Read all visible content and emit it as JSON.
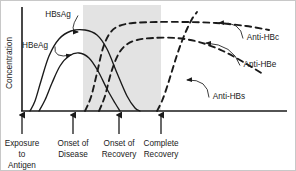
{
  "chart_data": {
    "type": "line",
    "title": "",
    "subtitle": "",
    "xlabel": "",
    "ylabel": "Concentration",
    "grid": false,
    "legend_position": "inline-annotations",
    "xlim": [
      0,
      1
    ],
    "ylim": [
      0,
      1
    ],
    "x_event_labels": [
      {
        "id": "exposure",
        "line1": "Exposure",
        "line2": "to",
        "line3": "Antigen",
        "x_px": 21
      },
      {
        "id": "onset-disease",
        "line1": "Onset of",
        "line2": "Disease",
        "line3": "",
        "x_px": 72
      },
      {
        "id": "onset-recovery",
        "line1": "Onset of",
        "line2": "Recovery",
        "line3": "",
        "x_px": 118
      },
      {
        "id": "complete-recovery",
        "line1": "Complete",
        "line2": "Recovery",
        "line3": "",
        "x_px": 160
      }
    ],
    "shaded_region": {
      "label": "acute disease period",
      "x_start_px": 82,
      "x_end_px": 160,
      "color": "#e3e3e3"
    },
    "series": [
      {
        "name": "HBsAg",
        "style": "solid",
        "color": "#1a1a1a",
        "kind": "antigen",
        "description": "rises after exposure, broad high peak, falls to zero by complete recovery",
        "points": [
          [
            29,
            110
          ],
          [
            34,
            100
          ],
          [
            40,
            80
          ],
          [
            48,
            55
          ],
          [
            58,
            38
          ],
          [
            70,
            30
          ],
          [
            84,
            29
          ],
          [
            96,
            34
          ],
          [
            106,
            48
          ],
          [
            116,
            72
          ],
          [
            126,
            95
          ],
          [
            134,
            107
          ],
          [
            139,
            110
          ]
        ]
      },
      {
        "name": "HBeAg",
        "style": "solid",
        "color": "#1a1a1a",
        "kind": "antigen",
        "description": "rises slightly later, lower narrower peak, declines before HBsAg",
        "points": [
          [
            38,
            110
          ],
          [
            44,
            99
          ],
          [
            51,
            82
          ],
          [
            59,
            65
          ],
          [
            68,
            55
          ],
          [
            78,
            52
          ],
          [
            88,
            57
          ],
          [
            97,
            70
          ],
          [
            106,
            88
          ],
          [
            114,
            102
          ],
          [
            119,
            110
          ]
        ]
      },
      {
        "name": "Anti-HBc",
        "style": "dashed",
        "color": "#1a1a1a",
        "kind": "antibody",
        "description": "first antibody to rise, highest sustained plateau through recovery",
        "points": [
          [
            84,
            110
          ],
          [
            90,
            96
          ],
          [
            96,
            72
          ],
          [
            102,
            47
          ],
          [
            109,
            32
          ],
          [
            118,
            25
          ],
          [
            132,
            22
          ],
          [
            155,
            21
          ],
          [
            185,
            21
          ],
          [
            215,
            22
          ],
          [
            245,
            25
          ],
          [
            268,
            29
          ]
        ]
      },
      {
        "name": "Anti-HBe",
        "style": "dashed",
        "color": "#1a1a1a",
        "kind": "antibody",
        "description": "rises after Anti-HBc to a lower plateau, then gently declines",
        "points": [
          [
            98,
            110
          ],
          [
            104,
            95
          ],
          [
            110,
            72
          ],
          [
            117,
            54
          ],
          [
            125,
            44
          ],
          [
            136,
            39
          ],
          [
            152,
            37
          ],
          [
            175,
            37
          ],
          [
            198,
            41
          ],
          [
            222,
            50
          ],
          [
            244,
            62
          ],
          [
            262,
            73
          ]
        ]
      },
      {
        "name": "Anti-HBs",
        "style": "dashed",
        "color": "#1a1a1a",
        "kind": "antibody",
        "description": "appears only at complete recovery, rises steeply and keeps climbing",
        "points": [
          [
            156,
            110
          ],
          [
            161,
            100
          ],
          [
            166,
            86
          ],
          [
            171,
            70
          ],
          [
            176,
            54
          ],
          [
            181,
            40
          ],
          [
            186,
            28
          ],
          [
            191,
            18
          ],
          [
            196,
            11
          ]
        ]
      }
    ],
    "annotations": [
      {
        "text": "HBsAg",
        "text_x": 57,
        "text_y": 13,
        "anchor": "middle",
        "leader_to": [
          77,
          31
        ]
      },
      {
        "text": "HBeAg",
        "text_x": 34,
        "text_y": 44,
        "anchor": "middle",
        "leader_to": [
          70,
          54
        ]
      },
      {
        "text": "Anti-HBc",
        "text_x": 262,
        "text_y": 36,
        "anchor": "middle",
        "leader_to": [
          218,
          22
        ]
      },
      {
        "text": "Anti-HBe",
        "text_x": 259,
        "text_y": 63,
        "anchor": "middle",
        "leader_to": [
          205,
          42
        ]
      },
      {
        "text": "Anti-HBs",
        "text_x": 228,
        "text_y": 95,
        "anchor": "middle",
        "leader_to": [
          186,
          79
        ]
      }
    ]
  },
  "axis": {
    "y_title": "Concentration",
    "y_axis_x_px": 21,
    "x_axis_y_px": 110,
    "axis_color": "#1a1a1a"
  }
}
